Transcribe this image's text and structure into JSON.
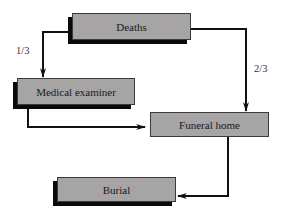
{
  "diagram": {
    "nodes": [
      {
        "id": "deaths",
        "label": "Deaths"
      },
      {
        "id": "medical_examiner",
        "label": "Medical examiner"
      },
      {
        "id": "funeral_home",
        "label": "Funeral home"
      },
      {
        "id": "burial",
        "label": "Burial"
      }
    ],
    "edges": [
      {
        "from": "deaths",
        "to": "medical_examiner",
        "label": "1/3"
      },
      {
        "from": "deaths",
        "to": "funeral_home",
        "label": "2/3"
      },
      {
        "from": "medical_examiner",
        "to": "funeral_home",
        "label": ""
      },
      {
        "from": "funeral_home",
        "to": "burial",
        "label": ""
      }
    ]
  }
}
